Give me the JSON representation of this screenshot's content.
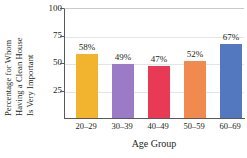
{
  "chart_data": {
    "type": "bar",
    "title": "",
    "subtitle": "",
    "xlabel": "Age Group",
    "ylabel": "Percentage for Whom Having a Clean House Is Very Important",
    "ylabel_lines": [
      "Percentage for Whom",
      "Having a Clean House",
      "Is Very Important"
    ],
    "categories": [
      "20–29",
      "30–39",
      "40–49",
      "50–59",
      "60–69"
    ],
    "values": [
      58,
      49,
      47,
      52,
      67
    ],
    "data_labels": [
      "58%",
      "49%",
      "47%",
      "52%",
      "67%"
    ],
    "colors": [
      "#F2B32E",
      "#9B7BC8",
      "#E83A55",
      "#F08A4F",
      "#5478C0"
    ],
    "ylim": [
      0,
      100
    ],
    "yticks": [
      25,
      50,
      75,
      100
    ],
    "ytick_labels": [
      "25",
      "50",
      "75",
      "100"
    ],
    "grid": true,
    "legend": "none"
  }
}
